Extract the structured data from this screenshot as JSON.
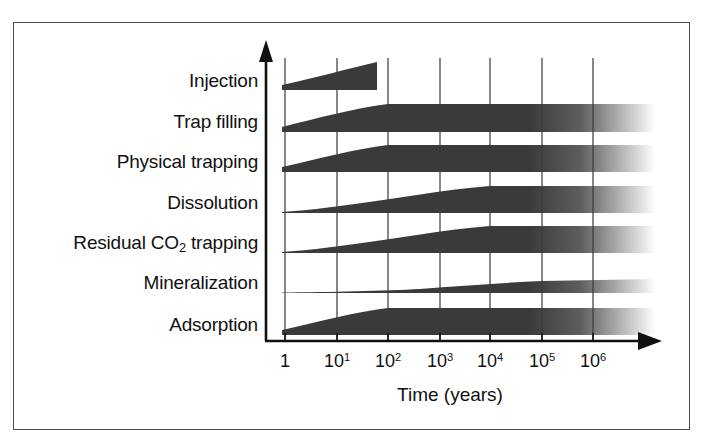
{
  "figure": {
    "kind": "co2-storage-trapping-timeline",
    "frame_border_color": "#4d4d4d",
    "background_color": "#ffffff",
    "band_fill_color": "#3a3a3a",
    "axis_color": "#111111",
    "gridline_color": "#555555"
  },
  "chart_data": {
    "type": "area",
    "title": "",
    "subtitle": "",
    "xlabel": "Time (years)",
    "ylabel": "",
    "xscale": "log",
    "x_tick_labels": [
      "1",
      "10¹",
      "10²",
      "10³",
      "10⁴",
      "10⁵",
      "10⁶"
    ],
    "x_tick_bases": [
      "1",
      "10",
      "10",
      "10",
      "10",
      "10",
      "10"
    ],
    "x_tick_exponents": [
      "",
      "1",
      "2",
      "3",
      "4",
      "5",
      "6"
    ],
    "x_tick_values": [
      1,
      10,
      100,
      1000,
      10000,
      100000,
      1000000
    ],
    "xlim": [
      1,
      1000000
    ],
    "grid": true,
    "grid_axis": "x",
    "legend": "none",
    "y_categories": [
      "Injection",
      "Trap filling",
      "Physical trapping",
      "Dissolution",
      "Residual CO₂ trapping",
      "Mineralization",
      "Adsorption"
    ],
    "series": [
      {
        "name": "Injection",
        "label_plain": "Injection",
        "start_log": 0.0,
        "end_log": 1.8,
        "terminates_abruptly": true,
        "fades_out": false,
        "thickness_points_log_thickness": [
          [
            0.0,
            0.18
          ],
          [
            0.4,
            0.38
          ],
          [
            1.0,
            0.7
          ],
          [
            1.8,
            1.0
          ]
        ],
        "description": "Grows steadily from time 1 and stops sharply before 10²."
      },
      {
        "name": "Trap filling",
        "label_plain": "Trap filling",
        "start_log": 0.0,
        "end_log": 6.6,
        "terminates_abruptly": false,
        "fades_out": true,
        "thickness_points_log_thickness": [
          [
            0.0,
            0.1
          ],
          [
            0.6,
            0.22
          ],
          [
            1.2,
            0.45
          ],
          [
            1.7,
            0.8
          ],
          [
            2.0,
            1.0
          ],
          [
            6.0,
            1.0
          ]
        ],
        "description": "Ramps up from time 1, saturates near 10² and persists, fading after 10⁶."
      },
      {
        "name": "Physical trapping",
        "label_plain": "Physical trapping",
        "start_log": 0.0,
        "end_log": 6.6,
        "terminates_abruptly": false,
        "fades_out": true,
        "thickness_points_log_thickness": [
          [
            0.0,
            0.12
          ],
          [
            0.6,
            0.26
          ],
          [
            1.2,
            0.5
          ],
          [
            1.7,
            0.82
          ],
          [
            2.0,
            1.0
          ],
          [
            6.0,
            1.0
          ]
        ],
        "description": "Mirrors trap filling; full thickness by 10² onward."
      },
      {
        "name": "Dissolution",
        "label_plain": "Dissolution",
        "start_log": 0.45,
        "end_log": 6.6,
        "terminates_abruptly": false,
        "fades_out": true,
        "thickness_points_log_thickness": [
          [
            0.45,
            0.02
          ],
          [
            1.2,
            0.1
          ],
          [
            2.0,
            0.3
          ],
          [
            2.8,
            0.62
          ],
          [
            3.6,
            0.95
          ],
          [
            4.0,
            1.0
          ],
          [
            6.0,
            1.0
          ]
        ],
        "description": "Begins slowly after time 1, reaching full thickness near 10⁴."
      },
      {
        "name": "Residual CO₂ trapping",
        "label_plain": "Residual CO2 trapping",
        "start_log": 0.3,
        "end_log": 6.6,
        "terminates_abruptly": false,
        "fades_out": true,
        "thickness_points_log_thickness": [
          [
            0.3,
            0.02
          ],
          [
            1.2,
            0.1
          ],
          [
            2.0,
            0.32
          ],
          [
            2.8,
            0.66
          ],
          [
            3.6,
            0.96
          ],
          [
            4.0,
            1.0
          ],
          [
            6.0,
            1.0
          ]
        ],
        "description": "Slow onset, saturating around 10⁴ and holding."
      },
      {
        "name": "Mineralization",
        "label_plain": "Mineralization",
        "start_log": 1.0,
        "end_log": 6.6,
        "terminates_abruptly": false,
        "fades_out": true,
        "thickness_points_log_thickness": [
          [
            1.0,
            0.01
          ],
          [
            2.0,
            0.03
          ],
          [
            3.0,
            0.1
          ],
          [
            4.0,
            0.26
          ],
          [
            5.0,
            0.42
          ],
          [
            6.0,
            0.52
          ]
        ],
        "description": "Hairline until 10³, then thickens gradually but never saturates."
      },
      {
        "name": "Adsorption",
        "label_plain": "Adsorption",
        "start_log": 0.0,
        "end_log": 6.6,
        "terminates_abruptly": false,
        "fades_out": true,
        "thickness_points_log_thickness": [
          [
            0.0,
            0.12
          ],
          [
            0.6,
            0.26
          ],
          [
            1.2,
            0.5
          ],
          [
            1.7,
            0.84
          ],
          [
            2.0,
            1.0
          ],
          [
            6.0,
            1.0
          ]
        ],
        "description": "Rises quickly to full thickness by 10² and stays constant."
      }
    ]
  },
  "axis": {
    "x_title": "Time (years)",
    "y_arrow": "up-arrow",
    "x_arrow": "right-arrow"
  }
}
